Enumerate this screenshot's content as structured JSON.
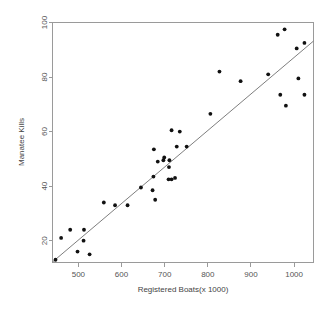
{
  "chart_data": {
    "type": "scatter",
    "title": "",
    "xlabel": "Registered Boats(x 1000)",
    "ylabel": "Manatee Kills",
    "xlim": [
      440,
      1045
    ],
    "ylim": [
      12,
      100
    ],
    "xticks": [
      500,
      600,
      700,
      800,
      900,
      1000
    ],
    "yticks": [
      20,
      40,
      60,
      80,
      100
    ],
    "grid": false,
    "legend": null,
    "series": [
      {
        "name": "Manatee deaths vs registered boats",
        "marker": "filled-circle",
        "color": "#111111",
        "x": [
          447,
          460,
          481,
          498,
          513,
          512,
          526,
          559,
          585,
          614,
          645,
          675,
          674,
          672,
          678,
          684,
          697,
          699,
          709,
          710,
          711,
          716,
          716,
          728,
          724,
          735,
          751,
          806,
          827,
          876,
          940,
          962,
          968,
          978,
          981,
          1006,
          1010,
          1024,
          1024
        ],
        "y": [
          13,
          21,
          24,
          16,
          24,
          20,
          15,
          34,
          33,
          33,
          39.5,
          53.5,
          43.5,
          38.5,
          35,
          49,
          49.5,
          50.5,
          42.5,
          47,
          49.5,
          42.5,
          60.5,
          54.5,
          43,
          60,
          54.5,
          66.5,
          82,
          78.5,
          81,
          95.5,
          73.5,
          97.5,
          69.5,
          90.5,
          79.5,
          92.5,
          73.5
        ]
      }
    ],
    "fit_line": {
      "type": "linear-regression",
      "x_start": 440,
      "y_start": 12.2,
      "x_end": 1045,
      "y_end": 93.2
    }
  },
  "axes": {
    "x_tick_labels": [
      "500",
      "600",
      "700",
      "800",
      "900",
      "1000"
    ],
    "y_tick_labels": [
      "20",
      "40",
      "60",
      "80",
      "100"
    ],
    "x_axis_title": "Registered Boats(x 1000)",
    "y_axis_title": "Manatee Kills"
  }
}
